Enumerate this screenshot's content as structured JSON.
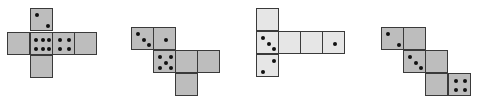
{
  "figure": {
    "face_size": 22,
    "colors": {
      "face_fill_dark": "#bdbdbd",
      "face_fill_light": "#e6e6e6",
      "edge": "#3a3a3a",
      "pip": "#111111"
    }
  },
  "nets": [
    {
      "id": "net-1",
      "style": "dark",
      "faces": [
        {
          "x": 30,
          "y": 8,
          "pips": 2,
          "orientation": "diag-down"
        },
        {
          "x": 7,
          "y": 32,
          "pips": 0
        },
        {
          "x": 30,
          "y": 32,
          "pips": 6,
          "orientation": "rows"
        },
        {
          "x": 52,
          "y": 32,
          "pips": 4
        },
        {
          "x": 74,
          "y": 32,
          "pips": 0
        },
        {
          "x": 30,
          "y": 55,
          "pips": 0
        }
      ]
    },
    {
      "id": "net-2",
      "style": "dark",
      "faces": [
        {
          "x": 131,
          "y": 27,
          "pips": 3,
          "orientation": "diag-down"
        },
        {
          "x": 153,
          "y": 27,
          "pips": 1
        },
        {
          "x": 153,
          "y": 50,
          "pips": 5
        },
        {
          "x": 175,
          "y": 50,
          "pips": 0
        },
        {
          "x": 197,
          "y": 50,
          "pips": 0
        },
        {
          "x": 175,
          "y": 73,
          "pips": 0
        }
      ]
    },
    {
      "id": "net-3",
      "style": "light",
      "faces": [
        {
          "x": 256,
          "y": 8,
          "pips": 0
        },
        {
          "x": 256,
          "y": 31,
          "pips": 3,
          "orientation": "diag-down"
        },
        {
          "x": 278,
          "y": 31,
          "pips": 0
        },
        {
          "x": 300,
          "y": 31,
          "pips": 0
        },
        {
          "x": 322,
          "y": 31,
          "pips": 1
        },
        {
          "x": 256,
          "y": 54,
          "pips": 2,
          "orientation": "diag-up"
        }
      ]
    },
    {
      "id": "net-4",
      "style": "dark",
      "faces": [
        {
          "x": 381,
          "y": 27,
          "pips": 2,
          "orientation": "diag-down"
        },
        {
          "x": 403,
          "y": 27,
          "pips": 0
        },
        {
          "x": 403,
          "y": 50,
          "pips": 3,
          "orientation": "diag-down"
        },
        {
          "x": 425,
          "y": 50,
          "pips": 0
        },
        {
          "x": 425,
          "y": 73,
          "pips": 0
        },
        {
          "x": 448,
          "y": 73,
          "pips": 4
        }
      ]
    }
  ]
}
